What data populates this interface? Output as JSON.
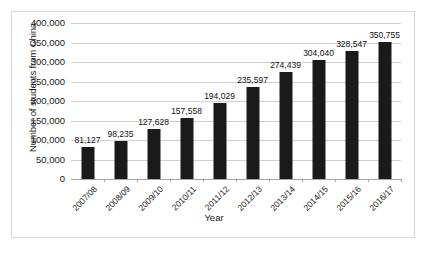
{
  "chart_data": {
    "type": "bar",
    "title": "",
    "xlabel": "Year",
    "ylabel": "Number of students from China",
    "categories": [
      "2007/08",
      "2008/09",
      "2009/10",
      "2010/11",
      "2011/12",
      "2012/13",
      "2013/14",
      "2014/15",
      "2015/16",
      "2016/17"
    ],
    "values": [
      81127,
      98235,
      127628,
      157558,
      194029,
      235597,
      274439,
      304040,
      328547,
      350755
    ],
    "data_labels": [
      "81,127",
      "98,235",
      "127,628",
      "157,558",
      "194,029",
      "235,597",
      "274,439",
      "304,040",
      "328,547",
      "350,755"
    ],
    "ylim": [
      0,
      400000
    ],
    "ytick_values": [
      400000,
      350000,
      300000,
      250000,
      200000,
      150000,
      100000,
      50000,
      0
    ],
    "ytick_labels": [
      "400,000",
      "350,000",
      "300,000",
      "250,000",
      "200,000",
      "150,000",
      "100,000",
      "50,000",
      "0"
    ],
    "grid": true,
    "legend": false,
    "bar_color": "#1a1a1a",
    "gridline_color": "#d0d0d0",
    "axis_color": "#a6a6a6",
    "border_color": "#d8d8d8",
    "background_color": "#ffffff"
  }
}
